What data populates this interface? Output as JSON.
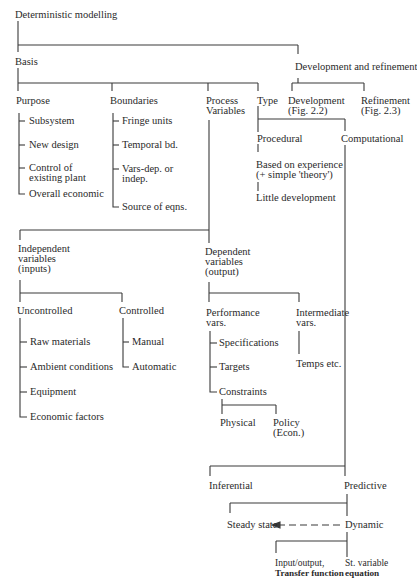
{
  "diagram": {
    "title": "Deterministic modelling",
    "top_cutoff_text": "",
    "nodes": {
      "root": "Deterministic modelling",
      "basis": "Basis",
      "dev_refine": "Development and refinement",
      "purpose": "Purpose",
      "boundaries": "Boundaries",
      "process_vars": [
        "Process",
        "Variables"
      ],
      "type": "Type",
      "development": [
        "Development",
        "(Fig. 2.2)"
      ],
      "refinement": [
        "Refinement",
        "(Fig. 2.3)"
      ],
      "purpose_items": [
        "Subsystem",
        "New design",
        "Control of|existing plant",
        "Overall economic"
      ],
      "boundaries_items": [
        "Fringe units",
        "Temporal bd.",
        "Vars-dep. or|indep.",
        "Source of eqns."
      ],
      "procedural": "Procedural",
      "computational": "Computational",
      "based_on_experience": [
        "Based on experience",
        "(+ simple 'theory')"
      ],
      "little_development": "Little development",
      "independent": [
        "Independent",
        "variables",
        "(inputs)"
      ],
      "dependent": [
        "Dependent",
        "variables",
        "(output)"
      ],
      "uncontrolled": "Uncontrolled",
      "controlled": "Controlled",
      "uncontrolled_items": [
        "Raw materials",
        "Ambient conditions",
        "Equipment",
        "Economic factors"
      ],
      "controlled_items": [
        "Manual",
        "Automatic"
      ],
      "performance": [
        "Performance",
        "vars."
      ],
      "intermediate": [
        "Intermediate",
        "vars."
      ],
      "performance_items": [
        "Specifications",
        "Targets",
        "Constraints"
      ],
      "temps": "Temps etc.",
      "physical": "Physical",
      "policy": [
        "Policy",
        "(Econ.)"
      ],
      "inferential": "Inferential",
      "predictive": "Predictive",
      "steady_state": "Steady state",
      "dynamic": "Dynamic",
      "input_output": [
        "Input/output,",
        "Transfer function"
      ],
      "state_variable": [
        "St. variable",
        "equation"
      ]
    },
    "edges": [
      [
        "Deterministic modelling",
        "Basis"
      ],
      [
        "Deterministic modelling",
        "Development and refinement"
      ],
      [
        "Basis",
        "Purpose"
      ],
      [
        "Basis",
        "Boundaries"
      ],
      [
        "Basis",
        "Process Variables"
      ],
      [
        "Basis",
        "Type"
      ],
      [
        "Development and refinement",
        "Development (Fig. 2.2)"
      ],
      [
        "Development and refinement",
        "Refinement (Fig. 2.3)"
      ],
      [
        "Type",
        "Procedural"
      ],
      [
        "Type",
        "Computational"
      ],
      [
        "Procedural",
        "Based on experience (+ simple 'theory')"
      ],
      [
        "Based on experience (+ simple 'theory')",
        "Little development"
      ],
      [
        "Process Variables",
        "Independent variables (inputs)"
      ],
      [
        "Process Variables",
        "Dependent variables (output)"
      ],
      [
        "Independent variables (inputs)",
        "Uncontrolled"
      ],
      [
        "Independent variables (inputs)",
        "Controlled"
      ],
      [
        "Dependent variables (output)",
        "Performance vars."
      ],
      [
        "Dependent variables (output)",
        "Intermediate vars."
      ],
      [
        "Intermediate vars.",
        "Temps etc."
      ],
      [
        "Constraints",
        "Physical"
      ],
      [
        "Constraints",
        "Policy (Econ.)"
      ],
      [
        "Computational",
        "Inferential"
      ],
      [
        "Computational",
        "Predictive"
      ],
      [
        "Predictive",
        "Steady state"
      ],
      [
        "Predictive",
        "Dynamic"
      ],
      [
        "Dynamic",
        "Steady state",
        "dashed-arrow"
      ],
      [
        "Dynamic",
        "Input/output, Transfer function"
      ],
      [
        "Dynamic",
        "St. variable equation"
      ]
    ]
  }
}
